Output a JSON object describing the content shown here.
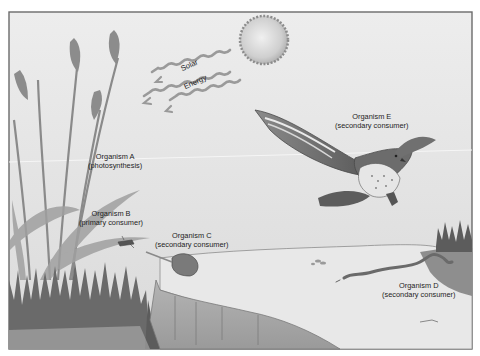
{
  "diagram": {
    "type": "food-chain-ecosystem-illustration",
    "colors": {
      "background": "#e4e4e4",
      "frame": "#6e6e6e",
      "sky_top": "#ececec",
      "sky_bottom": "#dcdcdc",
      "vegetation": "#7a7a7a",
      "dark_vegetation": "#5a5a5a",
      "water": "#e6e6e6",
      "bank": "#a8a8a8",
      "sun": "#c8c8c8"
    },
    "sun": {
      "rays_label_line1": "Solar",
      "rays_label_line2": "Energy"
    },
    "organisms": [
      {
        "id": "A",
        "name": "Organism A",
        "role": "(photosynthesis)",
        "depicts": "grass / grain plant"
      },
      {
        "id": "B",
        "name": "Organism B",
        "role": "(primary consumer)",
        "depicts": "grasshopper"
      },
      {
        "id": "C",
        "name": "Organism C",
        "role": "(secondary consumer)",
        "depicts": "toad"
      },
      {
        "id": "D",
        "name": "Organism D",
        "role": "(secondary consumer)",
        "depicts": "snake"
      },
      {
        "id": "E",
        "name": "Organism E",
        "role": "(secondary consumer)",
        "depicts": "hawk"
      }
    ]
  }
}
